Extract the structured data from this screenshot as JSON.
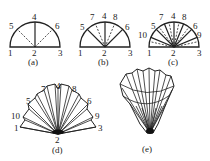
{
  "figure": {
    "panels": [
      {
        "id": "a",
        "caption": "(a)",
        "points": [
          "1",
          "2",
          "3",
          "4",
          "5",
          "6"
        ]
      },
      {
        "id": "b",
        "caption": "(b)",
        "points": [
          "1",
          "2",
          "3",
          "4",
          "5",
          "6",
          "7",
          "8"
        ]
      },
      {
        "id": "c",
        "caption": "(c)",
        "points": [
          "1",
          "2",
          "3",
          "4",
          "5",
          "6",
          "7",
          "8",
          "9",
          "10"
        ]
      },
      {
        "id": "d",
        "caption": "(d)",
        "points": [
          "1",
          "2",
          "3",
          "4",
          "5",
          "6",
          "7",
          "8",
          "9",
          "10"
        ]
      },
      {
        "id": "e",
        "caption": "(e)"
      }
    ],
    "labels": {
      "l1": "1",
      "l2": "2",
      "l3": "3",
      "l4": "4",
      "l5": "5",
      "l6": "6",
      "l7": "7",
      "l8": "8",
      "l9": "9",
      "l10": "10"
    },
    "colors": {
      "stroke": "#222222",
      "background": "#ffffff"
    }
  }
}
